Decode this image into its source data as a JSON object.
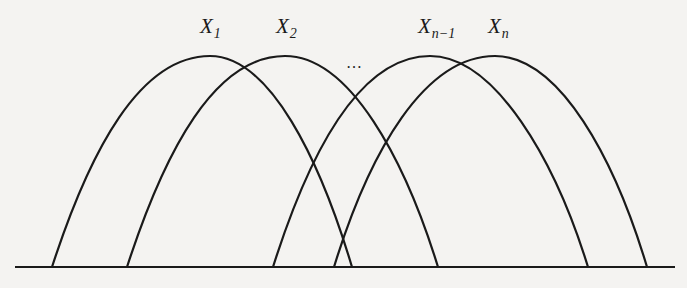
{
  "diagram": {
    "labels": [
      {
        "base": "X",
        "sub": "1",
        "x": 200,
        "y": 16
      },
      {
        "base": "X",
        "sub": "2",
        "x": 276,
        "y": 16
      },
      {
        "base": "X",
        "sub": "n−1",
        "x": 418,
        "y": 16
      },
      {
        "base": "X",
        "sub": "n",
        "x": 488,
        "y": 16
      }
    ],
    "ellipsis": "…",
    "curves": [
      {
        "start": 52,
        "peak_x": 210,
        "end": 352
      },
      {
        "start": 127,
        "peak_x": 285,
        "end": 438
      },
      {
        "start": 273,
        "peak_x": 430,
        "end": 588
      },
      {
        "start": 334,
        "peak_x": 495,
        "end": 647
      }
    ],
    "baseline": {
      "x1": 15,
      "x2": 675,
      "y": 267
    },
    "peak_y": 56,
    "line_color": "#1a1a1a"
  }
}
